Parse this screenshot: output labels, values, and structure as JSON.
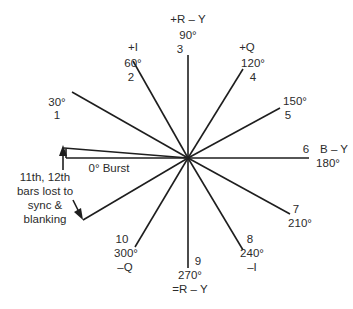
{
  "diagram": {
    "center": [
      188,
      158
    ],
    "line_color": "#1e1e1e",
    "vectors": [
      {
        "bar": "1",
        "angle": "30°",
        "axis": "",
        "end": [
          72,
          92
        ]
      },
      {
        "bar": "2",
        "angle": "60°",
        "axis": "+I",
        "end": [
          133,
          61
        ]
      },
      {
        "bar": "3",
        "angle": "90°",
        "axis": "+R – Y",
        "end": [
          188,
          55
        ]
      },
      {
        "bar": "4",
        "angle": "120°",
        "axis": "+Q",
        "end": [
          243,
          69
        ]
      },
      {
        "bar": "5",
        "angle": "150°",
        "axis": "",
        "end": [
          280,
          108
        ]
      },
      {
        "bar": "6",
        "angle": "180°",
        "axis": "B – Y",
        "end": [
          309,
          158
        ]
      },
      {
        "bar": "7",
        "angle": "210°",
        "axis": "",
        "end": [
          290,
          214
        ]
      },
      {
        "bar": "8",
        "angle": "240°",
        "axis": "–I",
        "end": [
          243,
          250
        ]
      },
      {
        "bar": "9",
        "angle": "270°",
        "axis": "=R – Y",
        "end": [
          188,
          268
        ]
      },
      {
        "bar": "10",
        "angle": "300°",
        "axis": "–Q",
        "end": [
          135,
          247
        ]
      }
    ],
    "burst_label": "0° Burst",
    "note": "11th, 12th bars lost to sync & blanking"
  }
}
